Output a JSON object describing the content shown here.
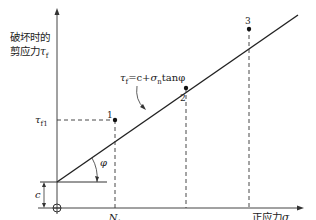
{
  "diagram": {
    "y_axis_label_line1": "破坏时的",
    "y_axis_label_line2": "剪应力",
    "y_axis_symbol": "τ",
    "y_axis_symbol_sub": "f",
    "x_axis_label": "正应力",
    "x_axis_symbol": "σ",
    "x_axis_symbol_sub": "n",
    "equation": {
      "lhs": "τ",
      "lhs_sub": "f",
      "rhs_1": "=c+",
      "sigma": "σ",
      "sigma_sub": "n",
      "rhs_2": "tanφ"
    },
    "tau_f1_label": "τ",
    "tau_f1_sub": "f1",
    "cohesion_label": "c",
    "angle_label": "φ",
    "x_tick": {
      "numerator": "N",
      "numerator_sub": "1",
      "denominator": "L",
      "denominator_sup": "2"
    },
    "points": [
      {
        "label": "1",
        "x": 115,
        "y": 120
      },
      {
        "label": "2",
        "x": 186,
        "y": 87
      },
      {
        "label": "3",
        "x": 249,
        "y": 28
      }
    ],
    "colors": {
      "line": "#222222",
      "background": "#ffffff"
    }
  }
}
